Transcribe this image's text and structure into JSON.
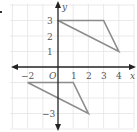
{
  "diagram": {
    "type": "coordinate-plane",
    "axes": {
      "x_label": "x",
      "y_label": "y",
      "origin_label": "O",
      "x_ticks": [
        {
          "value": -2,
          "label": "−2"
        },
        {
          "value": 1,
          "label": "1"
        },
        {
          "value": 2,
          "label": "2"
        },
        {
          "value": 3,
          "label": "3"
        },
        {
          "value": 4,
          "label": "4"
        }
      ],
      "y_ticks": [
        {
          "value": 3,
          "label": "3"
        },
        {
          "value": 2,
          "label": "2"
        },
        {
          "value": 1,
          "label": "1"
        },
        {
          "value": -3,
          "label": "−3"
        }
      ],
      "x_range": [
        -3,
        5
      ],
      "y_range": [
        -4,
        4
      ]
    },
    "shapes": [
      {
        "name": "triangle-upper",
        "vertices": [
          [
            0,
            3
          ],
          [
            3,
            3
          ],
          [
            4,
            1
          ]
        ]
      },
      {
        "name": "triangle-lower",
        "vertices": [
          [
            -2,
            -1
          ],
          [
            1,
            -1
          ],
          [
            2,
            -3
          ]
        ]
      }
    ],
    "colors": {
      "grid": "#e4e4e4",
      "axis": "#222222",
      "shape": "#8c8c8c",
      "text": "#555555"
    }
  }
}
